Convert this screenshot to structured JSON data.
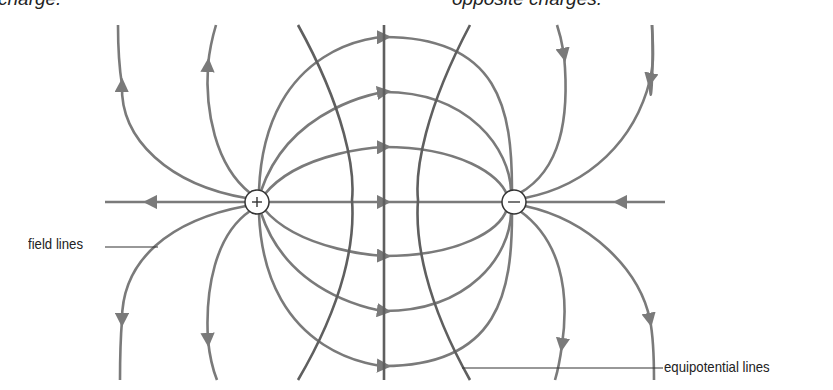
{
  "captions": {
    "left": "charge.",
    "right": "opposite charges."
  },
  "charges": {
    "positive": {
      "symbol": "+",
      "cx": 257,
      "cy": 202
    },
    "negative": {
      "symbol": "−",
      "cx": 514,
      "cy": 202
    }
  },
  "labels": {
    "field_lines": "field lines",
    "equipotential_lines": "equipotential lines"
  },
  "colors": {
    "field_line": "#7a7a7a",
    "equipotential_line": "#5f5f5f",
    "leader_line": "#333333",
    "text": "#222222"
  }
}
